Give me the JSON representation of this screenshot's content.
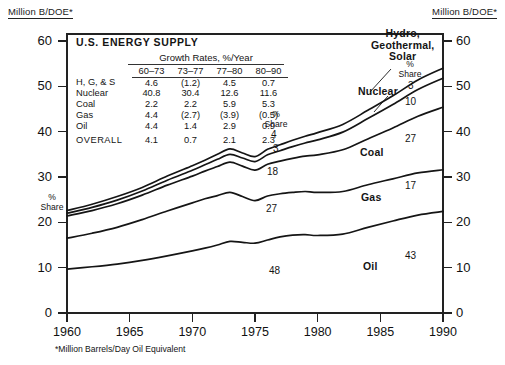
{
  "axis_caption_left": "Million B/DOE*",
  "axis_caption_right": "Million B/DOE*",
  "footnote": "*Million Barrels/Day Oil Equivalent",
  "panel": {
    "title": "U.S. ENERGY SUPPLY",
    "growth_header": "Growth Rates, %/Year",
    "columns": [
      "60–73",
      "73–77",
      "77–80",
      "80–90"
    ],
    "rows": [
      {
        "label": "H, G, & S",
        "values": [
          "4.6",
          "(1.2)",
          "4.5",
          "0.7"
        ]
      },
      {
        "label": "Nuclear",
        "values": [
          "40.8",
          "30.4",
          "12.6",
          "11.6"
        ]
      },
      {
        "label": "Coal",
        "values": [
          "2.2",
          "2.2",
          "5.9",
          "5.3"
        ]
      },
      {
        "label": "Gas",
        "values": [
          "4.4",
          "(2.7)",
          "(3.9)",
          "(0.5)"
        ]
      },
      {
        "label": "Oil",
        "values": [
          "4.4",
          "1.4",
          "2.9",
          "0.9"
        ]
      }
    ],
    "overall": {
      "label": "OVERALL",
      "values": [
        "4.1",
        "0.7",
        "2.1",
        "2.3"
      ]
    }
  },
  "labels": {
    "hydro": "Hydro,\nGeothermal,\nSolar",
    "hydro_line1": "Hydro,",
    "hydro_line2": "Geothermal,",
    "hydro_line3": "Solar",
    "nuclear": "Nuclear",
    "coal": "Coal",
    "gas": "Gas",
    "oil": "Oil"
  },
  "share_captions": {
    "left": "%\nShare",
    "left_l1": "%",
    "left_l2": "Share",
    "mid_l1": "%",
    "mid_l2": "Share",
    "right_l1": "%",
    "right_l2": "Share"
  },
  "share_mid": {
    "hgs": "4",
    "nuclear": "3",
    "coal": "18",
    "gas": "27",
    "oil": "48"
  },
  "share_right": {
    "hgs": "3",
    "nuclear": "10",
    "coal": "27",
    "gas": "17",
    "oil": "43"
  },
  "chart_data": {
    "type": "area",
    "title": "U.S. ENERGY SUPPLY",
    "xlabel": "",
    "ylabel": "Million B/DOE*",
    "xlim": [
      1960,
      1990
    ],
    "ylim": [
      0,
      60
    ],
    "yticks": [
      0,
      10,
      20,
      30,
      40,
      50,
      60
    ],
    "xticks": [
      1960,
      1965,
      1970,
      1975,
      1980,
      1985,
      1990
    ],
    "grid": false,
    "legend": "inline-curve-labels",
    "stacking": "cumulative",
    "x": [
      1960,
      1962,
      1964,
      1966,
      1968,
      1970,
      1971,
      1972,
      1973,
      1974,
      1975,
      1976,
      1977,
      1978,
      1979,
      1980,
      1982,
      1984,
      1986,
      1988,
      1990
    ],
    "series": [
      {
        "name": "Oil",
        "cumulative": [
          9.7,
          10.2,
          10.8,
          11.6,
          12.6,
          13.7,
          14.3,
          15.0,
          15.8,
          15.6,
          15.4,
          16.1,
          16.8,
          17.2,
          17.3,
          17.1,
          17.4,
          18.9,
          20.3,
          21.6,
          22.4
        ],
        "share_mid": 48,
        "share_right": 43
      },
      {
        "name": "Gas",
        "cumulative": [
          16.5,
          17.6,
          18.9,
          20.6,
          22.5,
          24.3,
          25.2,
          25.9,
          26.6,
          25.7,
          24.8,
          25.8,
          26.3,
          26.6,
          26.8,
          26.6,
          26.8,
          28.3,
          29.6,
          30.9,
          31.6
        ],
        "share_mid": 27,
        "share_right": 17
      },
      {
        "name": "Coal",
        "cumulative": [
          21.4,
          22.6,
          24.1,
          26.0,
          28.2,
          30.2,
          31.3,
          32.3,
          33.3,
          32.4,
          31.5,
          32.8,
          33.5,
          34.1,
          34.6,
          34.9,
          36.0,
          38.4,
          40.8,
          43.4,
          45.4
        ],
        "share_mid": 18,
        "share_right": 27
      },
      {
        "name": "Nuclear",
        "cumulative": [
          22.0,
          23.3,
          24.9,
          26.9,
          29.3,
          31.5,
          32.7,
          33.9,
          35.0,
          34.2,
          33.4,
          34.9,
          35.8,
          36.7,
          37.5,
          38.2,
          39.9,
          42.9,
          46.0,
          49.3,
          51.8
        ],
        "share_mid": 3,
        "share_right": 10
      },
      {
        "name": "Hydro, Geothermal, Solar",
        "cumulative": [
          22.6,
          24.0,
          25.7,
          27.7,
          30.2,
          32.5,
          33.7,
          35.0,
          36.2,
          35.3,
          34.5,
          36.1,
          37.1,
          38.1,
          39.0,
          39.8,
          41.6,
          44.7,
          47.9,
          51.4,
          54.0
        ],
        "share_mid": 4,
        "share_right": 3
      }
    ],
    "growth_rates_table": {
      "periods": [
        "60-73",
        "73-77",
        "77-80",
        "80-90"
      ],
      "rows": {
        "H, G, & S": [
          4.6,
          -1.2,
          4.5,
          0.7
        ],
        "Nuclear": [
          40.8,
          30.4,
          12.6,
          11.6
        ],
        "Coal": [
          2.2,
          2.2,
          5.9,
          5.3
        ],
        "Gas": [
          4.4,
          -2.7,
          -3.9,
          -0.5
        ],
        "Oil": [
          4.4,
          1.4,
          2.9,
          0.9
        ],
        "OVERALL": [
          4.1,
          0.7,
          2.1,
          2.3
        ]
      }
    }
  }
}
